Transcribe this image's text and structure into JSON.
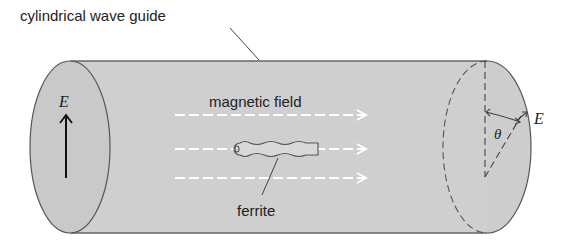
{
  "diagram": {
    "title_label": "cylindrical wave guide",
    "left_field_label": "E",
    "field_label": "magnetic field",
    "ferrite_label": "ferrite",
    "angle_label": "θ",
    "right_field_label": "E"
  },
  "colors": {
    "cylinder_fill": "#cfcfcf",
    "outline": "#555555",
    "field_lines": "#ffffff",
    "text": "#222222"
  }
}
